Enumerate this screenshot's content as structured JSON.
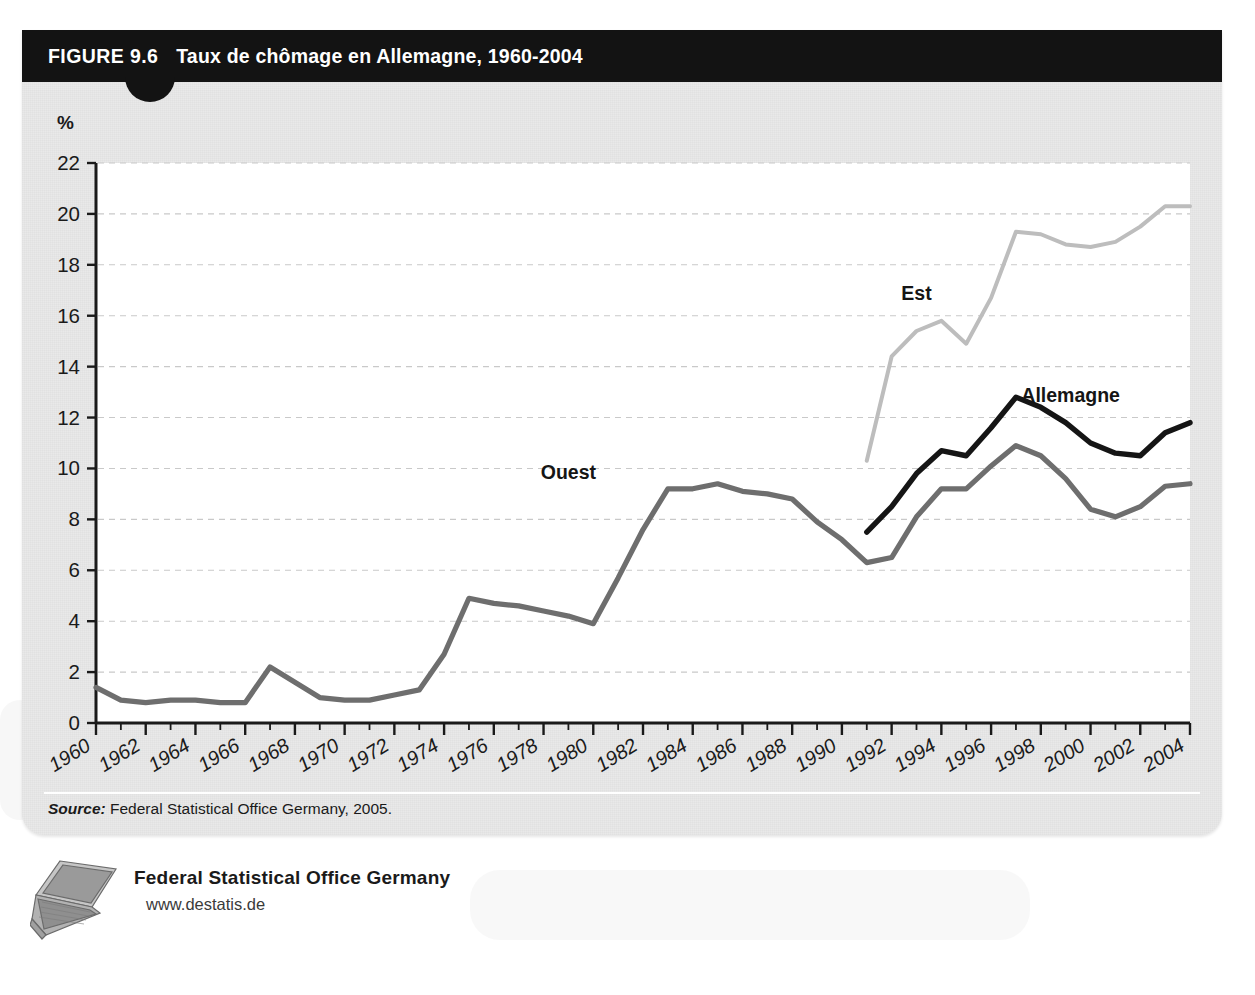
{
  "figure": {
    "number": "FIGURE 9.6",
    "title": "Taux de chômage en Allemagne, 1960-2004",
    "y_unit": "%",
    "source_label": "Source:",
    "source_text": " Federal Statistical Office Germany, 2005."
  },
  "footer": {
    "org_name": "Federal Statistical Office Germany",
    "url": "www.destatis.de",
    "icon": "laptop-icon"
  },
  "colors": {
    "header_bg": "#131313",
    "card_bg": "#e9e9e9",
    "plot_bg": "#ffffff",
    "axis": "#1a1a1a",
    "grid": "#c9c9c9",
    "series_ouest": "#6e6e6e",
    "series_est": "#bdbdbd",
    "series_allemagne": "#151515"
  },
  "chart_data": {
    "type": "line",
    "title": "Taux de chômage en Allemagne, 1960-2004",
    "xlabel": "",
    "ylabel": "%",
    "ylim": [
      0,
      22
    ],
    "xlim": [
      1960,
      2004
    ],
    "ytick_step": 2,
    "yticks": [
      0,
      2,
      4,
      6,
      8,
      10,
      12,
      14,
      16,
      18,
      20,
      22
    ],
    "xticks": [
      1960,
      1962,
      1964,
      1966,
      1968,
      1970,
      1972,
      1974,
      1976,
      1978,
      1980,
      1982,
      1984,
      1986,
      1988,
      1990,
      1992,
      1994,
      1996,
      1998,
      2000,
      2002,
      2004
    ],
    "xtick_labels": [
      "1960",
      "1962",
      "1964",
      "1966",
      "1968",
      "1970",
      "1972",
      "1974",
      "1976",
      "1978",
      "1980",
      "1982",
      "1984",
      "1986",
      "1988",
      "1990",
      "1992",
      "1994",
      "1996",
      "1998",
      "2000",
      "2002",
      "2004"
    ],
    "grid": "horizontal-dashed",
    "legend": "inline-annotations",
    "annotations": [
      {
        "text": "Ouest",
        "x": 1979.0,
        "y": 9.6
      },
      {
        "text": "Est",
        "x": 1993.0,
        "y": 16.6
      },
      {
        "text": "Allemagne",
        "x": 1999.2,
        "y": 12.6
      }
    ],
    "series": [
      {
        "name": "Ouest",
        "color": "#6e6e6e",
        "x": [
          1960,
          1961,
          1962,
          1963,
          1964,
          1965,
          1966,
          1967,
          1968,
          1969,
          1970,
          1971,
          1972,
          1973,
          1974,
          1975,
          1976,
          1977,
          1978,
          1979,
          1980,
          1981,
          1982,
          1983,
          1984,
          1985,
          1986,
          1987,
          1988,
          1989,
          1990,
          1991,
          1992,
          1993,
          1994,
          1995,
          1996,
          1997,
          1998,
          1999,
          2000,
          2001,
          2002,
          2003,
          2004
        ],
        "values": [
          1.4,
          0.9,
          0.8,
          0.9,
          0.9,
          0.8,
          0.8,
          2.2,
          1.6,
          1.0,
          0.9,
          0.9,
          1.1,
          1.3,
          2.7,
          4.9,
          4.7,
          4.6,
          4.4,
          4.2,
          3.9,
          5.7,
          7.6,
          9.2,
          9.2,
          9.4,
          9.1,
          9.0,
          8.8,
          7.9,
          7.2,
          6.3,
          6.5,
          8.1,
          9.2,
          9.2,
          10.1,
          10.9,
          10.5,
          9.6,
          8.4,
          8.1,
          8.5,
          9.3,
          9.4
        ]
      },
      {
        "name": "Est",
        "color": "#bdbdbd",
        "x": [
          1991,
          1992,
          1993,
          1994,
          1995,
          1996,
          1997,
          1998,
          1999,
          2000,
          2001,
          2002,
          2003,
          2004
        ],
        "values": [
          10.3,
          14.4,
          15.4,
          15.8,
          14.9,
          16.7,
          19.3,
          19.2,
          18.8,
          18.7,
          18.9,
          19.5,
          20.3,
          20.3
        ]
      },
      {
        "name": "Allemagne",
        "color": "#151515",
        "x": [
          1991,
          1992,
          1993,
          1994,
          1995,
          1996,
          1997,
          1998,
          1999,
          2000,
          2001,
          2002,
          2003,
          2004
        ],
        "values": [
          7.5,
          8.5,
          9.8,
          10.7,
          10.5,
          11.6,
          12.8,
          12.4,
          11.8,
          11.0,
          10.6,
          10.5,
          11.4,
          11.8
        ]
      }
    ]
  }
}
